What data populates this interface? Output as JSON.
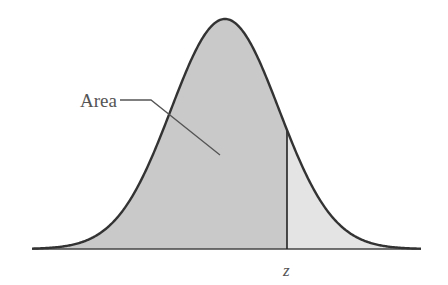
{
  "diagram": {
    "type": "normal-distribution-curve",
    "labels": {
      "area": "Area",
      "z": "z"
    },
    "colors": {
      "background": "#ffffff",
      "curve_stroke": "#333333",
      "area_fill": "#c9c9c9",
      "tail_fill": "#e4e4e4",
      "baseline": "#444444",
      "z_line": "#222222",
      "leader_line": "#555555"
    },
    "geometry": {
      "center_x": 225,
      "baseline_y": 249,
      "peak_y": 19,
      "sigma_px": 54,
      "x_start": 32,
      "x_end": 421,
      "z_x": 287
    }
  }
}
